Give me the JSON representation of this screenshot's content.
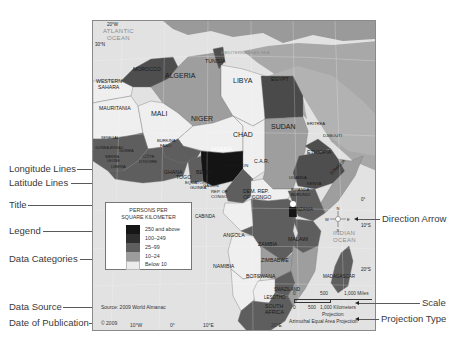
{
  "callouts": {
    "left": [
      {
        "label": "Longitude Lines",
        "y": 168
      },
      {
        "label": "Latitude Lines",
        "y": 182
      },
      {
        "label": "Title",
        "y": 204
      },
      {
        "label": "Legend",
        "y": 230
      },
      {
        "label": "Data Categories",
        "y": 258
      },
      {
        "label": "Data Source",
        "y": 306
      },
      {
        "label": "Date of Publication",
        "y": 322
      }
    ],
    "right": [
      {
        "label": "Direction Arrow",
        "y": 219
      },
      {
        "label": "Scale",
        "y": 303
      },
      {
        "label": "Projection Type",
        "y": 319
      }
    ]
  },
  "map": {
    "oceans": {
      "atlantic_1": "ATLANTIC",
      "atlantic_2": "OCEAN",
      "mediterranean": "MEDITERRANEAN SEA",
      "indian_1": "INDIAN",
      "indian_2": "OCEAN"
    },
    "graticule": {
      "lon_20w": "20°W",
      "lat_30n": "30°N",
      "lat_0": "0°",
      "lat_10s": "10°S",
      "lat_20s": "20°S",
      "lon_10w": "10°W",
      "lon_0": "0°",
      "lon_10e": "10°E",
      "lon_20e": "20°E"
    },
    "countries": {
      "morocco": "MOROCCO",
      "tunisia": "TUNISIA",
      "algeria": "ALGERIA",
      "libya": "LIBYA",
      "egypt": "EGYPT",
      "western_sahara_1": "WESTERN",
      "western_sahara_2": "SAHARA",
      "mauritania": "MAURITANIA",
      "mali": "MALI",
      "niger": "NIGER",
      "chad": "CHAD",
      "sudan": "SUDAN",
      "eritrea": "ERITREA",
      "djibouti": "DJIBOUTI",
      "ethiopia": "ETHIOPIA",
      "somalia": "SOMALIA",
      "nigeria": "NIGERIA",
      "ghana": "GHANA",
      "togo": "TOGO",
      "benin": "BENIN",
      "cameroon": "CAMEROON",
      "car": "C.A.R.",
      "eq_guinea_1": "EQUATORIAL",
      "eq_guinea_2": "GUINEA",
      "gabon": "GABON",
      "rep_congo_1": "REP. OF",
      "rep_congo_2": "CONGO",
      "drc_1": "DEM. REP.",
      "drc_2": "OF CONGO",
      "uganda": "UGANDA",
      "kenya": "KENYA",
      "rwanda": "RWANDA",
      "burundi": "BURUNDI",
      "tanzania": "TANZANIA",
      "cabinda": "CABINDA",
      "angola": "ANGOLA",
      "zambia": "ZAMBIA",
      "malawi": "MALAWI",
      "zimbabwe": "ZIMBABWE",
      "namibia": "NAMIBIA",
      "botswana": "BOTSWANA",
      "madagascar": "MADAGASCAR",
      "swaziland": "SWAZILAND",
      "lesotho": "LESOTHO",
      "south_africa_1": "SOUTH",
      "south_africa_2": "AFRICA",
      "cote_divoire_1": "CÔTE",
      "cote_divoire_2": "D'IVOIRE",
      "burkina_1": "BURKINA",
      "burkina_2": "FASO",
      "guinea": "GUINEA",
      "sierra_leone_1": "SIERRA",
      "sierra_leone_2": "LEONE",
      "liberia": "LIBERIA",
      "senegal": "SENEGAL",
      "guinea_bissau": "GUINEA-BISSAU"
    },
    "compass": {
      "n": "N",
      "s": "S",
      "e": "E",
      "w": "W"
    }
  },
  "legend": {
    "title_1": "PERSONS PER",
    "title_2": "SQUARE KILOMETER",
    "categories": [
      {
        "label": "250 and above",
        "color": "#161616"
      },
      {
        "label": "100–249",
        "color": "#2e2e2e"
      },
      {
        "label": "25–99",
        "color": "#5e5e5e"
      },
      {
        "label": "10–24",
        "color": "#9c9c9c"
      },
      {
        "label": "Below 10",
        "color": "#ececec"
      }
    ]
  },
  "footer": {
    "source": "Source: 2009 World Almanac",
    "copyright": "© 2009"
  },
  "scale": {
    "miles_0": "0",
    "miles_500": "500",
    "miles_1000": "1,000 Miles",
    "km_0": "0",
    "km_500": "500",
    "km_1000": "1,000 Kilometers",
    "projection_label": "Projection:",
    "projection_name": "Azimuthal Equal Area Projection"
  }
}
